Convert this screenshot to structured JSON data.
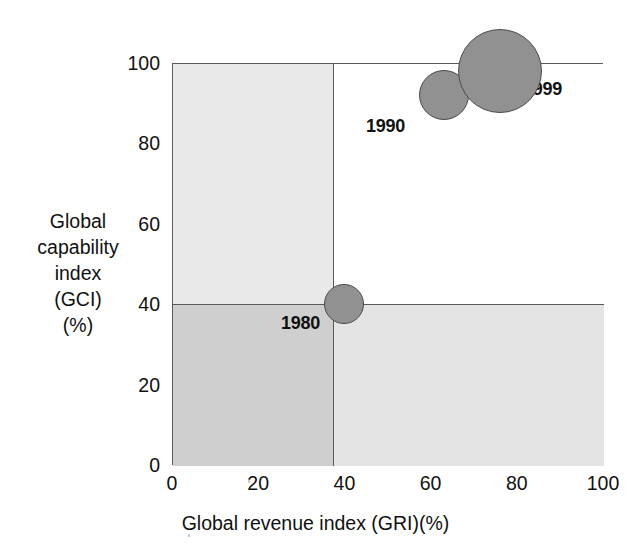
{
  "chart_data": {
    "type": "scatter",
    "title": "",
    "xlabel": "Global revenue index (GRI)(%)",
    "ylabel_lines": [
      "Global",
      "capability",
      "index",
      "(GCI)",
      "(%)"
    ],
    "ylabel": "Global capability index (GCI) (%)",
    "xlim": [
      0,
      100
    ],
    "ylim": [
      0,
      100
    ],
    "xticks": [
      "0",
      "20",
      "40",
      "60",
      "80",
      "100"
    ],
    "xtick_values": [
      0,
      20,
      40,
      60,
      80,
      100
    ],
    "yticks": [
      "0",
      "20",
      "40",
      "60",
      "80",
      "100"
    ],
    "ytick_values": [
      0,
      20,
      40,
      60,
      80,
      100
    ],
    "grid": false,
    "legend_position": "none",
    "quadrant_split": {
      "x": 40,
      "y": 40
    },
    "points": [
      {
        "label": "1980",
        "x": 40,
        "y": 40,
        "size_px": 40
      },
      {
        "label": "1990",
        "x": 63,
        "y": 92,
        "size_px": 50
      },
      {
        "label": "1999",
        "x": 76,
        "y": 98,
        "size_px": 84
      }
    ],
    "series": [
      {
        "name": "1980",
        "values": [
          40,
          40
        ]
      },
      {
        "name": "1990",
        "values": [
          63,
          92
        ]
      },
      {
        "name": "1999",
        "values": [
          76,
          98
        ]
      }
    ],
    "colors": {
      "bubble_fill": "#919191",
      "bubble_stroke": "#4a4a4a",
      "quadrant_upper_left": "#e9e9e9",
      "quadrant_lower_left": "#cfcfcf",
      "quadrant_lower_right": "#e4e4e4",
      "quadrant_upper_right": "#ffffff",
      "axis": "#5a5a5a",
      "text": "#111111"
    }
  }
}
